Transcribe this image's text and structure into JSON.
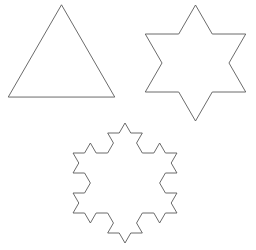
{
  "page": {
    "background_color": "#ffffff",
    "width": 256,
    "height": 250
  },
  "style": {
    "stroke_color": "#5a5a5a",
    "stroke_width": 0.9,
    "fill": "none"
  },
  "chart_data": {
    "type": "diagram",
    "subtitle": "",
    "xlabel": "",
    "ylabel": "",
    "grid": false,
    "legend": false,
    "axes": false,
    "figures": [
      {
        "name": "triangle",
        "label": "Equilateral triangle",
        "koch_iteration": 0,
        "segment_count": 3,
        "center_x": 61.5,
        "center_y": 66.3,
        "radius": 61.5,
        "rotation_deg": -90,
        "bbox": [
          10,
          5,
          113,
          97
        ],
        "stroke_color": "#5a5a5a"
      },
      {
        "name": "six-pointed-star",
        "label": "Six-pointed star",
        "koch_iteration": 1,
        "segment_count": 12,
        "center_x": 195.5,
        "center_y": 63.0,
        "radius": 58.0,
        "rotation_deg": -90,
        "bbox": [
          143,
          5,
          248,
          121
        ],
        "stroke_color": "#5a5a5a"
      },
      {
        "name": "koch-snowflake",
        "label": "Koch snowflake",
        "koch_iteration": 2,
        "segment_count": 48,
        "center_x": 125.0,
        "center_y": 183.0,
        "radius": 60.0,
        "rotation_deg": -90,
        "bbox": [
          70,
          123,
          180,
          243
        ],
        "stroke_color": "#5a5a5a"
      }
    ]
  }
}
